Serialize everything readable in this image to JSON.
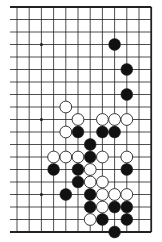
{
  "diagram": {
    "type": "go-board-partial",
    "columns": 12,
    "rows": 19,
    "edges": {
      "top": true,
      "right": true,
      "bottom": true,
      "left": false
    },
    "star_points": [
      {
        "col": 2,
        "row": 3
      },
      {
        "col": 2,
        "row": 9
      },
      {
        "col": 2,
        "row": 15
      }
    ],
    "stones": [
      {
        "col": 8,
        "row": 3,
        "color": "black"
      },
      {
        "col": 9,
        "row": 5,
        "color": "black"
      },
      {
        "col": 9,
        "row": 7,
        "color": "black"
      },
      {
        "col": 4,
        "row": 8,
        "color": "white"
      },
      {
        "col": 5,
        "row": 9,
        "color": "white"
      },
      {
        "col": 7,
        "row": 9,
        "color": "white"
      },
      {
        "col": 8,
        "row": 9,
        "color": "white"
      },
      {
        "col": 9,
        "row": 9,
        "color": "white"
      },
      {
        "col": 4,
        "row": 10,
        "color": "white"
      },
      {
        "col": 5,
        "row": 10,
        "color": "black"
      },
      {
        "col": 7,
        "row": 10,
        "color": "black"
      },
      {
        "col": 8,
        "row": 10,
        "color": "black"
      },
      {
        "col": 6,
        "row": 11,
        "color": "black"
      },
      {
        "col": 3,
        "row": 12,
        "color": "white"
      },
      {
        "col": 4,
        "row": 12,
        "color": "white"
      },
      {
        "col": 5,
        "row": 12,
        "color": "white"
      },
      {
        "col": 6,
        "row": 12,
        "color": "black"
      },
      {
        "col": 7,
        "row": 12,
        "color": "white"
      },
      {
        "col": 9,
        "row": 12,
        "color": "white"
      },
      {
        "col": 3,
        "row": 13,
        "color": "black"
      },
      {
        "col": 5,
        "row": 13,
        "color": "black"
      },
      {
        "col": 6,
        "row": 13,
        "color": "white"
      },
      {
        "col": 9,
        "row": 13,
        "color": "black"
      },
      {
        "col": 5,
        "row": 14,
        "color": "black"
      },
      {
        "col": 6,
        "row": 14,
        "color": "white"
      },
      {
        "col": 7,
        "row": 14,
        "color": "white"
      },
      {
        "col": 4,
        "row": 15,
        "color": "black"
      },
      {
        "col": 6,
        "row": 15,
        "color": "black"
      },
      {
        "col": 7,
        "row": 15,
        "color": "white"
      },
      {
        "col": 8,
        "row": 15,
        "color": "white"
      },
      {
        "col": 9,
        "row": 15,
        "color": "white"
      },
      {
        "col": 6,
        "row": 16,
        "color": "black"
      },
      {
        "col": 7,
        "row": 16,
        "color": "white"
      },
      {
        "col": 8,
        "row": 16,
        "color": "black"
      },
      {
        "col": 9,
        "row": 16,
        "color": "black"
      },
      {
        "col": 6,
        "row": 17,
        "color": "white"
      },
      {
        "col": 7,
        "row": 17,
        "color": "black"
      },
      {
        "col": 9,
        "row": 17,
        "color": "black"
      },
      {
        "col": 8,
        "row": 18,
        "color": "black"
      }
    ],
    "colors": {
      "background": "#ffffff",
      "line": "#222222",
      "black_stone": "#111111",
      "white_stone": "#ffffff",
      "stone_outline": "#222222"
    }
  }
}
